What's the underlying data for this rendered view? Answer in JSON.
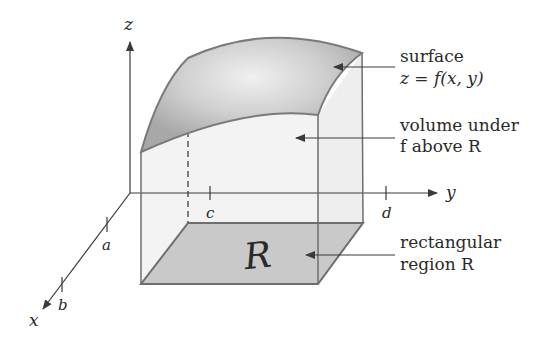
{
  "diagram": {
    "axes": {
      "z_label": "z",
      "y_label": "y",
      "x_label": "x"
    },
    "ticks": {
      "a": "a",
      "b": "b",
      "c": "c",
      "d": "d"
    },
    "region_glyph": "R",
    "annotations": {
      "surface_line1": "surface",
      "surface_line2": "z = f(x, y)",
      "volume_line1": "volume under",
      "volume_line2": "f above R",
      "region_line1": "rectangular",
      "region_line2": "region R"
    },
    "colors": {
      "surface_fill": "#a9a9a9",
      "surface_highlight": "#ececec",
      "box_fill": "#f2f2f2",
      "floor_fill": "#c9c9c9",
      "edge": "#6e6e6e",
      "axis": "#3a3a3a"
    }
  }
}
